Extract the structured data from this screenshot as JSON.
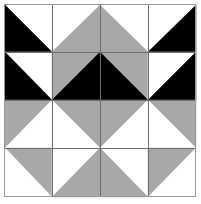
{
  "figure": {
    "width": 201,
    "height": 204
  },
  "colors": {
    "background": "#ffffff",
    "white": "#ffffff",
    "gray": "#a8a8a8",
    "black": "#000000",
    "grid_line": "#6e6e6e",
    "outer_frame": "#9a9a9a"
  },
  "grid": {
    "rows": 4,
    "columns": 4,
    "x_stops": [
      5,
      52,
      100,
      148,
      196
    ],
    "y_stops": [
      5,
      52,
      100,
      148,
      197
    ],
    "line_width": 1,
    "frame_width": 1
  },
  "chart_data": {
    "type": "heatmap",
    "xlabel": "",
    "ylabel": "",
    "legend": [
      "white",
      "gray",
      "black"
    ],
    "categories": [
      "col-1",
      "col-2",
      "col-3",
      "col-4"
    ],
    "cells": [
      {
        "row": 1,
        "col": 1,
        "split": "diag-tlbr",
        "upper": "white",
        "lower": "black"
      },
      {
        "row": 1,
        "col": 2,
        "split": "diag-trbl",
        "upper": "white",
        "lower": "gray"
      },
      {
        "row": 1,
        "col": 3,
        "split": "diag-tlbr",
        "upper": "white",
        "lower": "gray"
      },
      {
        "row": 1,
        "col": 4,
        "split": "diag-trbl",
        "upper": "white",
        "lower": "black"
      },
      {
        "row": 2,
        "col": 1,
        "split": "diag-tlbr",
        "upper": "white",
        "lower": "black"
      },
      {
        "row": 2,
        "col": 2,
        "split": "diag-trbl",
        "upper": "gray",
        "lower": "black"
      },
      {
        "row": 2,
        "col": 3,
        "split": "diag-tlbr",
        "upper": "gray",
        "lower": "black"
      },
      {
        "row": 2,
        "col": 4,
        "split": "diag-trbl",
        "upper": "white",
        "lower": "black"
      },
      {
        "row": 3,
        "col": 1,
        "split": "diag-trbl",
        "upper": "gray",
        "lower": "white"
      },
      {
        "row": 3,
        "col": 2,
        "split": "diag-tlbr",
        "upper": "gray",
        "lower": "white"
      },
      {
        "row": 3,
        "col": 3,
        "split": "diag-trbl",
        "upper": "gray",
        "lower": "white"
      },
      {
        "row": 3,
        "col": 4,
        "split": "diag-tlbr",
        "upper": "gray",
        "lower": "white"
      },
      {
        "row": 4,
        "col": 1,
        "split": "diag-tlbr",
        "upper": "gray",
        "lower": "white"
      },
      {
        "row": 4,
        "col": 2,
        "split": "diag-trbl",
        "upper": "white",
        "lower": "gray"
      },
      {
        "row": 4,
        "col": 3,
        "split": "diag-tlbr",
        "upper": "white",
        "lower": "gray"
      },
      {
        "row": 4,
        "col": 4,
        "split": "diag-trbl",
        "upper": "gray",
        "lower": "white"
      }
    ],
    "motifs": [
      {
        "name": "black-chevron-top",
        "color": "black"
      },
      {
        "name": "gray-diamond-center",
        "color": "gray"
      },
      {
        "name": "white-diamond-bottom",
        "color": "white"
      },
      {
        "name": "gray-chevrons-sides",
        "color": "gray"
      }
    ]
  }
}
